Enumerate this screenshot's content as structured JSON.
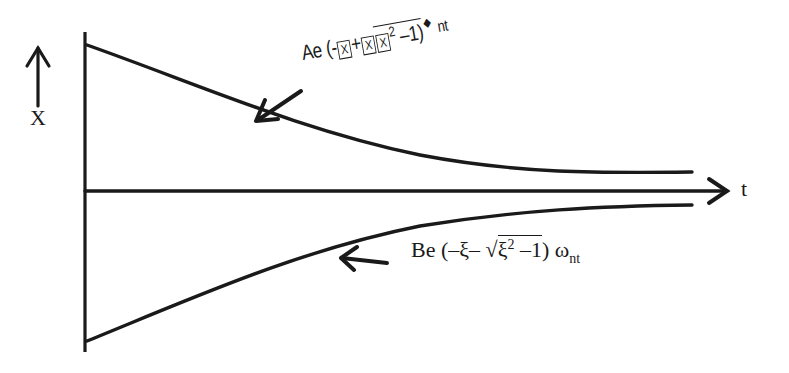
{
  "diagram": {
    "axes": {
      "vertical_label": "X",
      "horizontal_label": "t"
    },
    "curves": [
      {
        "name": "upper-curve",
        "description": "Positive decaying exponential",
        "formula": {
          "coefficient": "Ae",
          "open": "(-",
          "box1": "X",
          "plus": "+",
          "box2": "X",
          "box3": "X",
          "power": "2",
          "minus_one": " –1)",
          "dot": "◆",
          "tail": "nt"
        }
      },
      {
        "name": "lower-curve",
        "description": "Negative decaying exponential",
        "formula": {
          "coefficient": "Be",
          "open": "(–ξ–",
          "sqrt": "√",
          "xi": "ξ",
          "power": "2",
          "minus_one": " –1",
          "close": ")",
          "omega": "ω",
          "subscript": "nt"
        }
      }
    ],
    "colors": {
      "stroke": "#1a1a1a",
      "background": "#ffffff"
    }
  }
}
